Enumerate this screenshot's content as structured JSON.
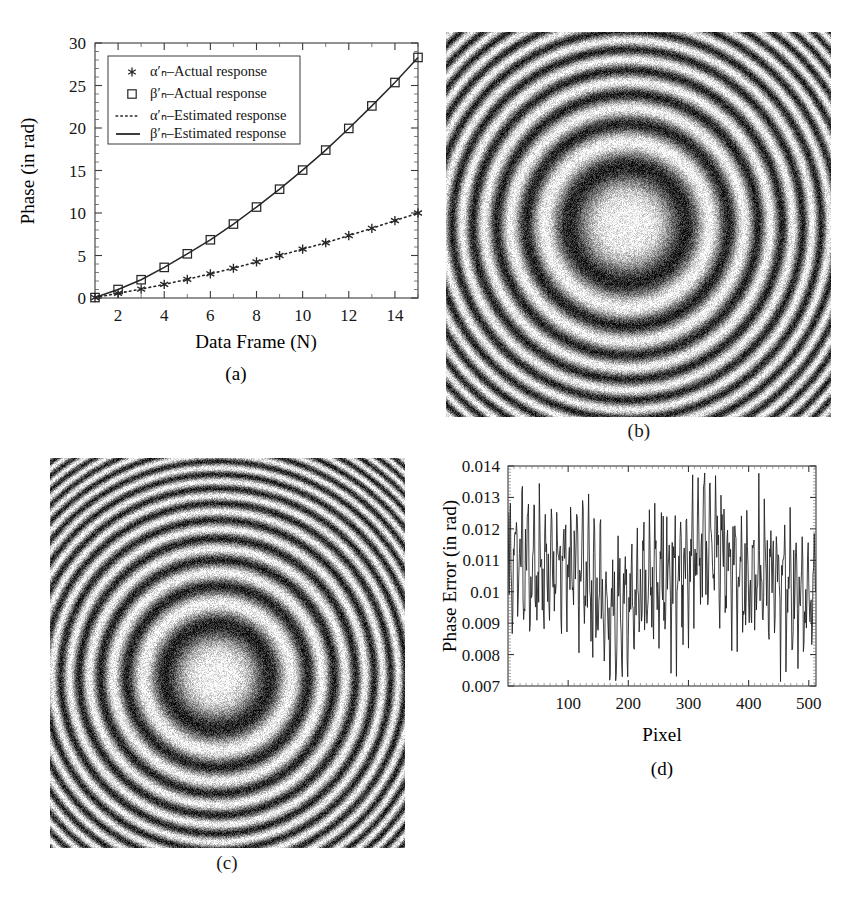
{
  "figure": {
    "background_color": "#ffffff",
    "ink_color": "#1a1a1a",
    "panel_labels": {
      "a": "(a)",
      "b": "(b)",
      "c": "(c)",
      "d": "(d)"
    }
  },
  "chart_data": [
    {
      "id": "panel-a",
      "type": "line",
      "title": "",
      "caption": "(a)",
      "xlabel": "Data Frame (N)",
      "ylabel": "Phase (in rad)",
      "xlim": [
        1,
        15
      ],
      "ylim": [
        0,
        30
      ],
      "xticks": [
        2,
        4,
        6,
        8,
        10,
        12,
        14
      ],
      "xtick_labels": [
        "2",
        "4",
        "6",
        "8",
        "10",
        "12",
        "14"
      ],
      "yticks": [
        0,
        5,
        10,
        15,
        20,
        25,
        30
      ],
      "ytick_labels": [
        "0",
        "5",
        "10",
        "15",
        "20",
        "25",
        "30"
      ],
      "grid": false,
      "legend_position": "upper-left",
      "x": [
        1,
        2,
        3,
        4,
        5,
        6,
        7,
        8,
        9,
        10,
        11,
        12,
        13,
        14,
        15
      ],
      "series": [
        {
          "name": "α′ₙ–Actual response",
          "marker": "asterisk",
          "linestyle": "none",
          "values": [
            0.05,
            0.55,
            1.05,
            1.6,
            2.2,
            2.85,
            3.5,
            4.25,
            5.0,
            5.75,
            6.5,
            7.35,
            8.2,
            9.1,
            10.0
          ]
        },
        {
          "name": "β′ₙ–Actual response",
          "marker": "square",
          "linestyle": "none",
          "values": [
            0.05,
            1.0,
            2.15,
            3.6,
            5.2,
            6.85,
            8.7,
            10.7,
            12.8,
            15.05,
            17.4,
            19.95,
            22.6,
            25.35,
            28.3
          ]
        },
        {
          "name": "α′ₙ–Estimated response",
          "marker": "none",
          "linestyle": "dotted",
          "values": [
            0.05,
            0.55,
            1.05,
            1.6,
            2.2,
            2.85,
            3.5,
            4.25,
            5.0,
            5.75,
            6.5,
            7.35,
            8.2,
            9.1,
            10.0
          ]
        },
        {
          "name": "β′ₙ–Estimated response",
          "marker": "none",
          "linestyle": "solid",
          "values": [
            0.05,
            1.0,
            2.15,
            3.6,
            5.2,
            6.85,
            8.7,
            10.7,
            12.8,
            15.05,
            17.4,
            19.95,
            22.6,
            25.35,
            28.3
          ]
        }
      ],
      "legend": [
        {
          "label": "α′ₙ–Actual response",
          "key": "alpha-actual",
          "symbol": "asterisk"
        },
        {
          "label": "β′ₙ–Actual response",
          "key": "beta-actual",
          "symbol": "square"
        },
        {
          "label": "α′ₙ–Estimated response",
          "key": "alpha-estimated",
          "symbol": "dotted-line"
        },
        {
          "label": "β′ₙ–Estimated response",
          "key": "beta-estimated",
          "symbol": "solid-line"
        }
      ]
    },
    {
      "id": "panel-b",
      "type": "heatmap",
      "caption": "(b)",
      "description": "Noisy circular interference fringe pattern (Newton's rings), grayscale",
      "ring_count": 9,
      "center_x_frac": 0.47,
      "center_y_frac": 0.5,
      "ring_period_px": 44,
      "noise": "high",
      "colormap": "gray"
    },
    {
      "id": "panel-c",
      "type": "heatmap",
      "caption": "(c)",
      "description": "Noisy circular interference fringe pattern with higher fringe density, grayscale",
      "ring_count": 11,
      "center_x_frac": 0.47,
      "center_y_frac": 0.56,
      "ring_period_px": 40,
      "noise": "high",
      "colormap": "gray"
    },
    {
      "id": "panel-d",
      "type": "line",
      "caption": "(d)",
      "xlabel": "Pixel",
      "ylabel": "Phase Error (in rad)",
      "xlim": [
        0,
        512
      ],
      "ylim": [
        0.007,
        0.014
      ],
      "xticks": [
        100,
        200,
        300,
        400,
        500
      ],
      "xtick_labels": [
        "100",
        "200",
        "300",
        "400",
        "500"
      ],
      "yticks": [
        0.007,
        0.008,
        0.009,
        0.01,
        0.011,
        0.012,
        0.013,
        0.014
      ],
      "ytick_labels": [
        "0.007",
        "0.008",
        "0.009",
        "0.01",
        "0.011",
        "0.012",
        "0.013",
        "0.014"
      ],
      "grid": false,
      "legend_position": "none",
      "series": [
        {
          "name": "phase-error",
          "linestyle": "solid",
          "mean": 0.0105,
          "min": 0.0071,
          "max": 0.0138,
          "samples": 512,
          "description": "High-frequency oscillating residual phase error trace"
        }
      ]
    }
  ]
}
